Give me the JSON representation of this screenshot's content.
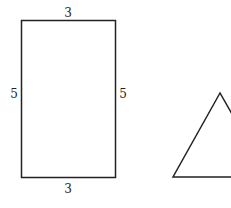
{
  "figures": {
    "rectangle": {
      "labels": {
        "top": "3",
        "left": "5",
        "right": "5",
        "bottom": "3"
      },
      "stroke": "#222222"
    },
    "triangle": {
      "stroke": "#222222"
    }
  }
}
